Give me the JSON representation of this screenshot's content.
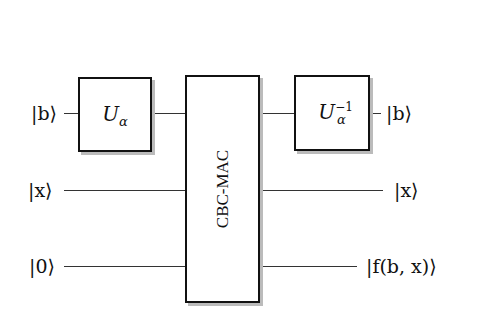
{
  "diagram": {
    "inputs": [
      {
        "label": "|b⟩"
      },
      {
        "label": "|x⟩"
      },
      {
        "label": "|0⟩"
      }
    ],
    "outputs": [
      {
        "label": "|b⟩"
      },
      {
        "label": "|x⟩"
      },
      {
        "label": "|f(b, x)⟩"
      }
    ],
    "gates": {
      "u_alpha": {
        "base": "U",
        "sub": "α"
      },
      "cbc_mac": {
        "label": "CBC-MAC"
      },
      "u_alpha_inv": {
        "base": "U",
        "sub": "α",
        "sup": "−1"
      }
    }
  }
}
